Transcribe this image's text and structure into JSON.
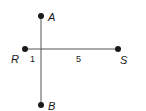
{
  "diagram": {
    "points": [
      {
        "name": "A",
        "x": 41,
        "y": 16
      },
      {
        "name": "R",
        "x": 25,
        "y": 49
      },
      {
        "name": "S",
        "x": 118,
        "y": 49
      },
      {
        "name": "B",
        "x": 41,
        "y": 105
      }
    ],
    "segments": [
      {
        "from": "A",
        "to": "B"
      },
      {
        "from": "R",
        "to": "S"
      }
    ],
    "labels": {
      "A": "A",
      "R": "R",
      "S": "S",
      "B": "B"
    },
    "lengths": {
      "left": "1",
      "right": "5"
    },
    "colors": {
      "ink": "#1a1a1a",
      "line": "#555555"
    }
  }
}
